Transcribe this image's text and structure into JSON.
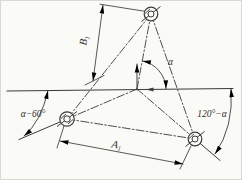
{
  "diagram": {
    "kind": "three-hole coordinate layout diagram",
    "labels": {
      "angle_center": "α",
      "angle_left": "α−60°",
      "angle_right": "120°−α",
      "dim_vertical_main": "B",
      "dim_vertical_sub": "1",
      "dim_horizontal_main": "A",
      "dim_horizontal_sub": "1"
    },
    "symbols": {
      "hole_marker": "double circle with diagonal slash hatch",
      "centerline_style": "dash-dot",
      "arrow_style": "slim filled triangle"
    },
    "colors": {
      "line": "#3b3b3b",
      "text": "#2e2e2e",
      "background": "#fafaf7"
    }
  }
}
